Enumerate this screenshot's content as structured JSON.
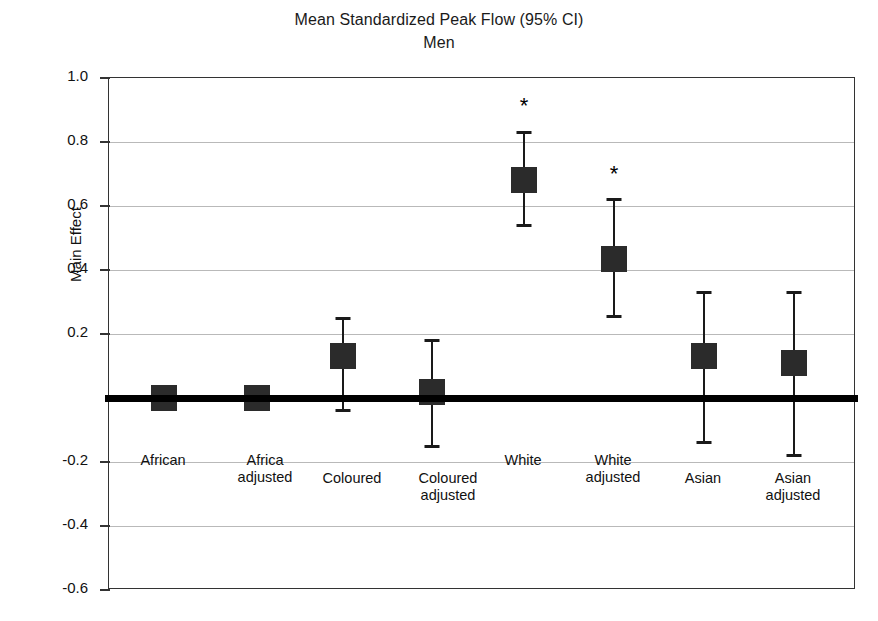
{
  "chart": {
    "title_lines": [
      "Mean Standardized Peak Flow (95% CI)",
      "Men"
    ],
    "ylabel": "Main Effect"
  },
  "chart_data": {
    "type": "scatter",
    "title": "Mean Standardized Peak Flow (95% CI)",
    "subtitle": "Men",
    "xlabel": "",
    "ylabel": "Main Effect",
    "ylim": [
      -0.6,
      1.0
    ],
    "yticks": [
      1.0,
      0.8,
      0.6,
      0.4,
      0.2,
      0.0,
      -0.2,
      -0.4,
      -0.6
    ],
    "ytick_labels": [
      "1.0",
      "0.8",
      "0.6",
      "0.4",
      "0.2",
      "",
      "-0.2",
      "-0.4",
      "-0.6"
    ],
    "grid": true,
    "legend": "none",
    "reference_line": 0.0,
    "categories": [
      "African",
      "Africa adjusted",
      "Coloured",
      "Coloured adjusted",
      "White",
      "White adjusted",
      "Asian",
      "Asian adjusted"
    ],
    "points": [
      {
        "label": "African",
        "value": 0.0,
        "ci_low": -0.01,
        "ci_high": 0.01,
        "significant": false,
        "marker": "square"
      },
      {
        "label": "Africa adjusted",
        "value": 0.0,
        "ci_low": -0.01,
        "ci_high": 0.01,
        "significant": false,
        "marker": "square"
      },
      {
        "label": "Coloured",
        "value": 0.13,
        "ci_low": -0.04,
        "ci_high": 0.25,
        "significant": false,
        "marker": "square"
      },
      {
        "label": "Coloured adjusted",
        "value": 0.02,
        "ci_low": -0.15,
        "ci_high": 0.18,
        "significant": false,
        "marker": "square"
      },
      {
        "label": "White",
        "value": 0.68,
        "ci_low": 0.54,
        "ci_high": 0.83,
        "significant": true,
        "marker": "square"
      },
      {
        "label": "White adjusted",
        "value": 0.435,
        "ci_low": 0.255,
        "ci_high": 0.62,
        "significant": true,
        "marker": "square"
      },
      {
        "label": "Asian",
        "value": 0.13,
        "ci_low": -0.14,
        "ci_high": 0.33,
        "significant": false,
        "marker": "square"
      },
      {
        "label": "Asian adjusted",
        "value": 0.11,
        "ci_low": -0.18,
        "ci_high": 0.33,
        "significant": false,
        "marker": "square"
      }
    ],
    "significance_symbol": "*",
    "colors": {
      "marker": "#2b2b2b",
      "whisker": "#1a1a1a",
      "grid": "#b9b9b9",
      "axis": "#333333",
      "zero_line": "#000000"
    }
  },
  "category_labels": [
    {
      "text": "African",
      "x": 163,
      "y": 452
    },
    {
      "text": "Africa\nadjusted",
      "x": 265,
      "y": 452
    },
    {
      "text": "Coloured",
      "x": 352,
      "y": 470
    },
    {
      "text": "Coloured\nadjusted",
      "x": 448,
      "y": 470
    },
    {
      "text": "White",
      "x": 523,
      "y": 452
    },
    {
      "text": "White\nadjusted",
      "x": 613,
      "y": 452
    },
    {
      "text": "Asian",
      "x": 703,
      "y": 470
    },
    {
      "text": "Asian\nadjusted",
      "x": 793,
      "y": 470
    }
  ],
  "y_axis_ticks": [
    {
      "label": "1.0",
      "value": 1.0
    },
    {
      "label": "0.8",
      "value": 0.8
    },
    {
      "label": "0.6",
      "value": 0.6
    },
    {
      "label": "0.4",
      "value": 0.4
    },
    {
      "label": "0.2",
      "value": 0.2
    },
    {
      "label": "-0.2",
      "value": -0.2
    },
    {
      "label": "-0.4",
      "value": -0.4
    },
    {
      "label": "-0.6",
      "value": -0.6
    }
  ],
  "marker_x_positions": [
    163,
    256,
    342,
    431,
    523,
    613,
    703,
    793
  ]
}
